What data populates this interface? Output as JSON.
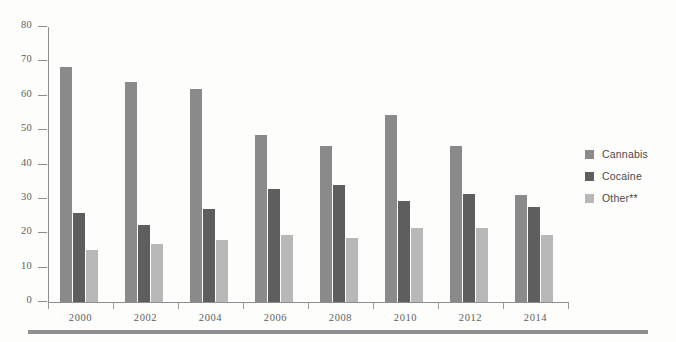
{
  "chart_data": {
    "type": "bar",
    "title": "",
    "subtitle": "",
    "xlabel": "",
    "ylabel": "",
    "categories": [
      "2000",
      "2002",
      "2004",
      "2006",
      "2008",
      "2010",
      "2012",
      "2014"
    ],
    "series": [
      {
        "name": "Cannabis",
        "color": "#8a8a8a",
        "values": [
          68.5,
          64.0,
          62.0,
          48.5,
          45.5,
          54.5,
          45.5,
          31.0
        ]
      },
      {
        "name": "Cocaine",
        "color": "#5e5e5e",
        "values": [
          26.0,
          22.5,
          27.0,
          33.0,
          34.0,
          29.5,
          31.5,
          27.5
        ]
      },
      {
        "name": "Other**",
        "color": "#b8b8b8",
        "values": [
          15.0,
          17.0,
          18.0,
          19.5,
          18.5,
          21.5,
          21.5,
          19.5
        ]
      }
    ],
    "ylim": [
      0,
      80
    ],
    "ytick_step": 10,
    "yticks": [
      "0",
      "10",
      "20",
      "30",
      "40",
      "50",
      "60",
      "70",
      "80"
    ],
    "grid": false,
    "legend_position": "right"
  },
  "legend": {
    "items": [
      {
        "label": "Cannabis",
        "color": "#8a8a8a"
      },
      {
        "label": "Cocaine",
        "color": "#5e5e5e"
      },
      {
        "label": "Other**",
        "color": "#b8b8b8"
      }
    ]
  },
  "axis": {
    "y_axis_color": "#8d8d8d",
    "x_axis_color": "#8d8d8d",
    "tick_label_color": "#5d5d5d"
  }
}
